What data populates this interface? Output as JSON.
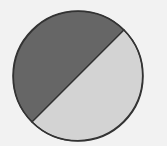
{
  "chart_data": {
    "type": "pie",
    "title": "",
    "legend": "none",
    "start_angle_deg": -45,
    "direction": "counterclockwise",
    "slices": [
      {
        "label": "",
        "value": 50,
        "color": "#666666"
      },
      {
        "label": "",
        "value": 50,
        "color": "#d3d3d3"
      }
    ],
    "outline_color": "#333333",
    "background_color": "#f2f2f2"
  }
}
